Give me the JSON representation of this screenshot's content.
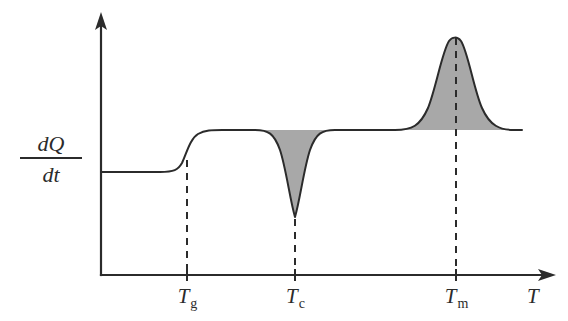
{
  "figure": {
    "type": "dsc-thermogram"
  },
  "axes": {
    "y_label_numerator": "dQ",
    "y_label_denominator": "dt",
    "x_label": "T",
    "x_ticks": [
      {
        "id": "tg",
        "base": "T",
        "sub": "g",
        "x": 187
      },
      {
        "id": "tc",
        "base": "T",
        "sub": "c",
        "x": 295
      },
      {
        "id": "tm",
        "base": "T",
        "sub": "m",
        "x": 456
      }
    ]
  },
  "colors": {
    "ink": "#2b2b2b",
    "peak_fill": "#a8a8a8",
    "background": "#ffffff"
  },
  "chart_data": {
    "type": "line",
    "title": "",
    "xlabel": "T",
    "ylabel": "dQ/dt",
    "grid": false,
    "legend": false,
    "annotations": [
      {
        "label": "Tg",
        "feature": "glass transition step",
        "x_px": 187,
        "direction": "step-up"
      },
      {
        "label": "Tc",
        "feature": "crystallization exotherm",
        "x_px": 295,
        "direction": "downward peak"
      },
      {
        "label": "Tm",
        "feature": "melting endotherm",
        "x_px": 456,
        "direction": "upward peak"
      }
    ],
    "baselines": {
      "pre_tg_y_px": 172,
      "post_tg_y_px": 130
    },
    "extrema": {
      "tc_min_y_px": 218,
      "tm_max_y_px": 38
    },
    "series": [
      {
        "name": "heat flow",
        "path": "M 101,172 L 160,172 C 174,172 178,170 182,163 C 187,152 190,139 198,134 C 205,130 212,130 222,130 L 255,130 C 268,130 274,133 280,150 C 286,168 290,200 295,217 C 300,200 304,168 310,150 C 316,133 322,130 335,130 L 395,130 C 412,130 420,126 428,108 C 436,88 442,52 449,41 C 452,37 457,36 461,41 C 468,52 474,90 482,108 C 490,126 500,130 514,130 L 522,130"
      }
    ],
    "fills": [
      {
        "name": "crystallization exotherm area",
        "color": "#a8a8a8",
        "path": "M 255,130 C 268,130 274,133 280,150 C 286,168 290,200 295,217 C 300,200 304,168 310,150 C 316,133 322,130 335,130 Z"
      },
      {
        "name": "melting endotherm area",
        "color": "#a8a8a8",
        "path": "M 395,130 C 412,130 420,126 428,108 C 436,88 442,52 449,41 C 452,37 457,36 461,41 C 468,52 474,90 482,108 C 490,126 500,130 514,130 Z"
      }
    ]
  }
}
